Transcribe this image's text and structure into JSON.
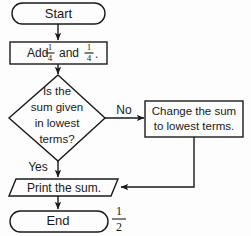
{
  "diagram": {
    "type": "flowchart",
    "nodes": {
      "start": {
        "shape": "terminal",
        "label": "Start"
      },
      "add": {
        "shape": "process",
        "label_prefix": "Add",
        "fraction_1": {
          "numerator": "1",
          "denominator": "4"
        },
        "label_middle": "and",
        "fraction_2": {
          "numerator": "1",
          "denominator": "4"
        },
        "label_suffix": "."
      },
      "decision": {
        "shape": "decision",
        "line1": "Is the",
        "line2": "sum given",
        "line3": "in lowest",
        "line4": "terms?"
      },
      "change": {
        "shape": "process",
        "line1": "Change the sum",
        "line2": "to lowest terms."
      },
      "print": {
        "shape": "input-output",
        "label": "Print the sum."
      },
      "end": {
        "shape": "terminal",
        "label": "End"
      }
    },
    "edge_labels": {
      "no": "No",
      "yes": "Yes"
    },
    "annotation": {
      "answer_fraction": {
        "numerator": "1",
        "denominator": "2"
      }
    },
    "colors": {
      "stroke": "#1a1a1a",
      "fill": "#fdfdfd",
      "background": "#fdfdfd"
    }
  }
}
